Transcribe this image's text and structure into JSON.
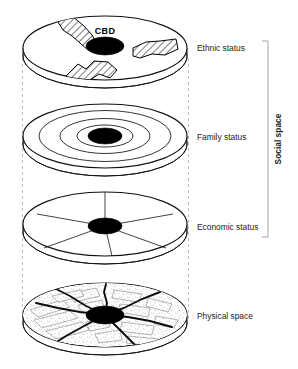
{
  "figure": {
    "core_label": "CBD",
    "bracket_label": "Social space",
    "layers": [
      {
        "id": "ethnic",
        "label": "Ethnic status",
        "pattern": "hatched-clusters",
        "cluster_count": 3
      },
      {
        "id": "family",
        "label": "Family status",
        "pattern": "concentric-zones",
        "ring_count": 3
      },
      {
        "id": "economic",
        "label": "Economic status",
        "pattern": "radial-sectors",
        "sector_count": 6
      },
      {
        "id": "physical",
        "label": "Physical space",
        "pattern": "street-grid-stipple",
        "radial_road_count": 6
      }
    ],
    "colors": {
      "outline": "#111111",
      "core": "#000000",
      "guide": "#b9b9b9",
      "bracket": "#9a9a9a",
      "road": "#0d0d0d",
      "street": "#6e6e6e",
      "background": "#ffffff"
    }
  }
}
